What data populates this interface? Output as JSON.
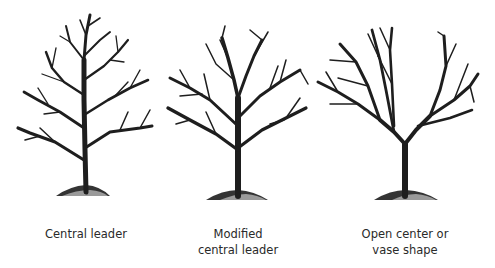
{
  "colors": {
    "background": "#ffffff",
    "branch": "#1e1e1e",
    "label": "#2a2a2a"
  },
  "trees": [
    {
      "id": "central-leader",
      "label_lines": [
        "Central leader"
      ]
    },
    {
      "id": "modified-central-leader",
      "label_lines": [
        "Modified",
        "central leader"
      ]
    },
    {
      "id": "open-center",
      "label_lines": [
        "Open center or",
        "vase shape"
      ]
    }
  ]
}
